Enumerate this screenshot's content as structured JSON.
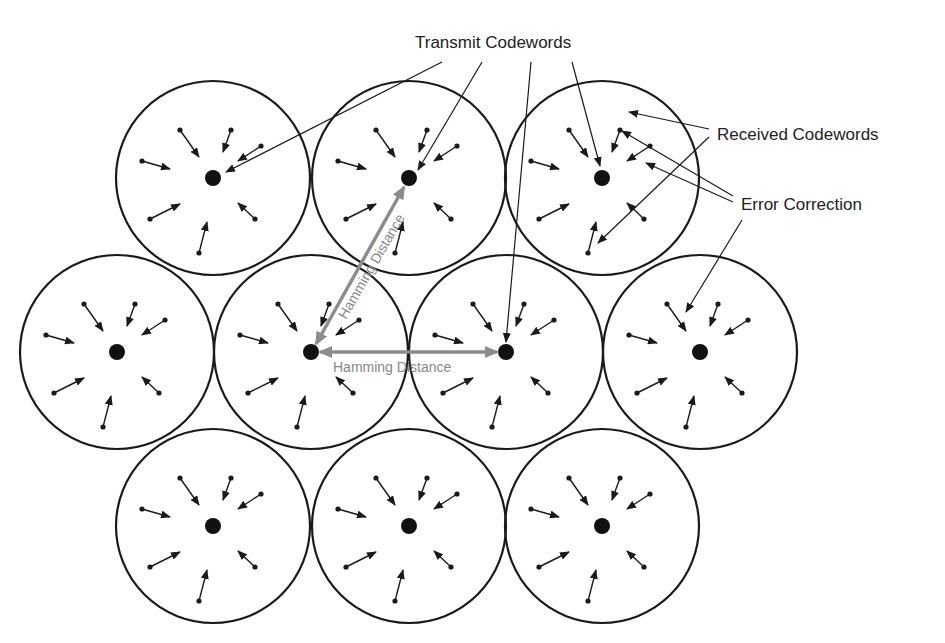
{
  "diagram": {
    "labels": {
      "transmit": "Transmit Codewords",
      "received": "Received Codewords",
      "error_correction": "Error Correction",
      "hamming_diag": "Hamming Distance",
      "hamming_horiz": "Hamming Distance"
    },
    "colors": {
      "stroke": "#1a1a1a",
      "hamming_arrow": "#8c8c8c",
      "background": "#ffffff"
    },
    "radius": 97,
    "circles": [
      {
        "id": "r1c1",
        "cx": 213,
        "cy": 178
      },
      {
        "id": "r1c2",
        "cx": 409,
        "cy": 178
      },
      {
        "id": "r1c3",
        "cx": 602,
        "cy": 178
      },
      {
        "id": "r2c1",
        "cx": 117,
        "cy": 352
      },
      {
        "id": "r2c2",
        "cx": 311,
        "cy": 352
      },
      {
        "id": "r2c3",
        "cx": 506,
        "cy": 352
      },
      {
        "id": "r2c4",
        "cx": 700,
        "cy": 352
      },
      {
        "id": "r3c1",
        "cx": 213,
        "cy": 526
      },
      {
        "id": "r3c2",
        "cx": 409,
        "cy": 526
      },
      {
        "id": "r3c3",
        "cx": 602,
        "cy": 526
      }
    ],
    "received_vectors": [
      {
        "from": [
          -33,
          -48
        ],
        "to": [
          -14,
          -21
        ]
      },
      {
        "from": [
          18,
          -48
        ],
        "to": [
          10,
          -26
        ]
      },
      {
        "from": [
          -71,
          -17
        ],
        "to": [
          -43,
          -9
        ]
      },
      {
        "from": [
          48,
          -32
        ],
        "to": [
          25,
          -17
        ]
      },
      {
        "from": [
          -63,
          41
        ],
        "to": [
          -33,
          26
        ]
      },
      {
        "from": [
          42,
          41
        ],
        "to": [
          25,
          25
        ]
      },
      {
        "from": [
          -14,
          75
        ],
        "to": [
          -6,
          44
        ]
      }
    ]
  }
}
